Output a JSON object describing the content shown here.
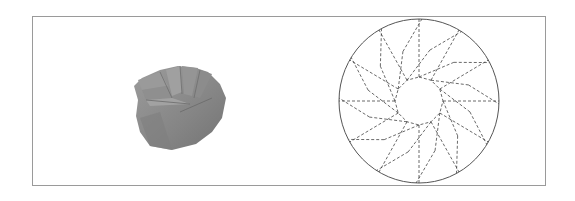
{
  "figure": {
    "panels": [
      {
        "id": "photo",
        "description": "folded origami model (twist fold)",
        "color": "#8a8a8a"
      },
      {
        "id": "crease_pattern",
        "description": "circular crease pattern with dashed folds",
        "outline_color": "#555555",
        "dash_color": "#444444"
      }
    ],
    "crease_pattern": {
      "center": [
        419,
        101
      ],
      "rx": 80,
      "ry": 82,
      "inner_radius": 24,
      "middle_radius": 52,
      "sides": 12,
      "twist_deg": 12
    }
  }
}
